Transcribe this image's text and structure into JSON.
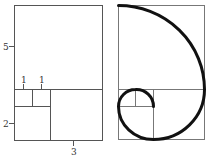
{
  "figure": {
    "left_panel": {
      "labels": {
        "square_5": "5",
        "square_1a": "1",
        "square_1b": "1",
        "square_2": "2",
        "square_3": "3"
      }
    },
    "right_panel": {
      "description": "Golden spiral drawn through Fibonacci squares"
    },
    "colors": {
      "rect_line": "#555555",
      "spiral": "#111111",
      "background": "#ffffff"
    }
  }
}
